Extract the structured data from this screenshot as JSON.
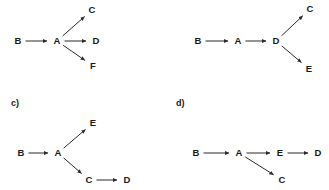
{
  "figure": {
    "background_color": "#ffffff",
    "stroke_color": "#2b2b2b",
    "text_color": "#1a1a1a",
    "width": 329,
    "height": 190,
    "panels": [
      {
        "id": "panel-a",
        "label": "",
        "label_visible": false,
        "nodes": [
          {
            "id": "B",
            "label": "B",
            "x": 18,
            "y": 41
          },
          {
            "id": "A",
            "label": "A",
            "x": 57,
            "y": 41
          },
          {
            "id": "C",
            "label": "C",
            "x": 92,
            "y": 10
          },
          {
            "id": "D",
            "label": "D",
            "x": 96,
            "y": 41
          },
          {
            "id": "F",
            "label": "F",
            "x": 93,
            "y": 66
          }
        ],
        "edges": [
          {
            "from": "B",
            "to": "A",
            "directed": true
          },
          {
            "from": "A",
            "to": "C",
            "directed": true
          },
          {
            "from": "A",
            "to": "D",
            "directed": true
          },
          {
            "from": "A",
            "to": "F",
            "directed": true
          }
        ]
      },
      {
        "id": "panel-b",
        "label": "",
        "label_visible": false,
        "nodes": [
          {
            "id": "B",
            "label": "B",
            "x": 198,
            "y": 41
          },
          {
            "id": "A",
            "label": "A",
            "x": 238,
            "y": 41
          },
          {
            "id": "D",
            "label": "D",
            "x": 276,
            "y": 41
          },
          {
            "id": "C",
            "label": "C",
            "x": 310,
            "y": 9
          },
          {
            "id": "E",
            "label": "E",
            "x": 309,
            "y": 69
          }
        ],
        "edges": [
          {
            "from": "B",
            "to": "A",
            "directed": true
          },
          {
            "from": "A",
            "to": "D",
            "directed": true
          },
          {
            "from": "D",
            "to": "C",
            "directed": true
          },
          {
            "from": "D",
            "to": "E",
            "directed": true
          }
        ]
      },
      {
        "id": "panel-c",
        "label": "c)",
        "label_visible": true,
        "label_x": 11,
        "label_y": 98,
        "nodes": [
          {
            "id": "B",
            "label": "B",
            "x": 21,
            "y": 153
          },
          {
            "id": "A",
            "label": "A",
            "x": 58,
            "y": 153
          },
          {
            "id": "E",
            "label": "E",
            "x": 93,
            "y": 123
          },
          {
            "id": "C",
            "label": "C",
            "x": 89,
            "y": 180
          },
          {
            "id": "D",
            "label": "D",
            "x": 127,
            "y": 180
          }
        ],
        "edges": [
          {
            "from": "B",
            "to": "A",
            "directed": true
          },
          {
            "from": "A",
            "to": "E",
            "directed": true
          },
          {
            "from": "A",
            "to": "C",
            "directed": true
          },
          {
            "from": "C",
            "to": "D",
            "directed": true
          }
        ]
      },
      {
        "id": "panel-d",
        "label": "d)",
        "label_visible": true,
        "label_x": 176,
        "label_y": 98,
        "nodes": [
          {
            "id": "B",
            "label": "B",
            "x": 196,
            "y": 153
          },
          {
            "id": "A",
            "label": "A",
            "x": 239,
            "y": 153
          },
          {
            "id": "E",
            "label": "E",
            "x": 280,
            "y": 153
          },
          {
            "id": "D",
            "label": "D",
            "x": 318,
            "y": 153
          },
          {
            "id": "C",
            "label": "C",
            "x": 282,
            "y": 180
          }
        ],
        "edges": [
          {
            "from": "B",
            "to": "A",
            "directed": true
          },
          {
            "from": "A",
            "to": "E",
            "directed": true
          },
          {
            "from": "E",
            "to": "D",
            "directed": true
          },
          {
            "from": "A",
            "to": "C",
            "directed": true
          }
        ]
      }
    ]
  }
}
